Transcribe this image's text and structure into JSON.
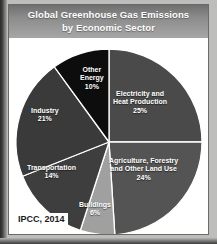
{
  "figure": {
    "title_line1": "Global Greenhouse Gas Emissions",
    "title_line2": "by Economic Sector",
    "source": "IPCC, 2014",
    "colors": {
      "title_bar": "#8c8c8c",
      "card": "#ffffff",
      "label_text": "#ffffff",
      "frame": "#6a6a68"
    }
  },
  "chart_data": {
    "type": "pie",
    "title": "Global Greenhouse Gas Emissions by Economic Sector",
    "subtitle": "by Economic Sector",
    "units": "percent of total global greenhouse gas emissions",
    "start_angle_deg": 0,
    "direction": "clockwise",
    "legend": "none (labels drawn inside slices)",
    "total": 100,
    "categories": [
      "Electricity and Heat Production",
      "Agriculture, Forestry and Other Land Use",
      "Buildings",
      "Transportation",
      "Industry",
      "Other Energy"
    ],
    "values": [
      25,
      24,
      6,
      14,
      21,
      10
    ],
    "slices": [
      {
        "label_line1": "Electricity and",
        "label_line2": "Heat Production",
        "name": "Electricity and Heat Production",
        "value": 25,
        "pct_text": "25%",
        "color": "#4a4a4a",
        "label_left": 104,
        "label_top": 52
      },
      {
        "label_line1": "Agriculture, Forestry",
        "label_line2": "and Other Land Use",
        "name": "Agriculture, Forestry and Other Land Use",
        "value": 24,
        "pct_text": "24%",
        "color": "#545454",
        "label_left": 100,
        "label_top": 119
      },
      {
        "label_line1": "Buildings",
        "label_line2": "",
        "name": "Buildings",
        "value": 6,
        "pct_text": "6%",
        "color": "#a0a0a0",
        "label_left": 70,
        "label_top": 163
      },
      {
        "label_line1": "Transportation",
        "label_line2": "",
        "name": "Transportation",
        "value": 14,
        "pct_text": "14%",
        "color": "#3e3e3e",
        "label_left": 18,
        "label_top": 126
      },
      {
        "label_line1": "Industry",
        "label_line2": "",
        "name": "Industry",
        "value": 21,
        "pct_text": "21%",
        "color": "#3a3a3a",
        "label_left": 22,
        "label_top": 69
      },
      {
        "label_line1": "Other",
        "label_line2": "Energy",
        "name": "Other Energy",
        "value": 10,
        "pct_text": "10%",
        "color": "#0d0d0d",
        "label_left": 71,
        "label_top": 28
      }
    ]
  }
}
